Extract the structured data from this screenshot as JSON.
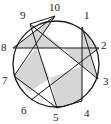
{
  "diagram": {
    "type": "circle-chord-diagram",
    "circle": {
      "cx": 56,
      "cy": 64,
      "r": 43
    },
    "colors": {
      "stroke": "#1a1a1a",
      "fill": "#d6d6d6",
      "label": "#222222"
    },
    "points": [
      {
        "id": "1",
        "x": 82,
        "y": 27,
        "lx": 84,
        "ly": 10
      },
      {
        "id": "2",
        "x": 99,
        "y": 48,
        "lx": 101,
        "ly": 40
      },
      {
        "id": "3",
        "x": 98,
        "y": 79,
        "lx": 103,
        "ly": 76
      },
      {
        "id": "4",
        "x": 82,
        "y": 101,
        "lx": 84,
        "ly": 108
      },
      {
        "id": "5",
        "x": 57,
        "y": 108,
        "lx": 53,
        "ly": 112
      },
      {
        "id": "6",
        "x": 31,
        "y": 100,
        "lx": 21,
        "ly": 105
      },
      {
        "id": "7",
        "x": 14,
        "y": 76,
        "lx": 2,
        "ly": 75
      },
      {
        "id": "8",
        "x": 13,
        "y": 48,
        "lx": 1,
        "ly": 42
      },
      {
        "id": "9",
        "x": 30,
        "y": 24,
        "lx": 20,
        "ly": 10
      },
      {
        "id": "10",
        "x": 55,
        "y": 16,
        "lx": 49,
        "ly": 2
      }
    ],
    "chords": [
      [
        "8",
        "2"
      ],
      [
        "1",
        "4"
      ],
      [
        "1",
        "3"
      ],
      [
        "9",
        "3"
      ],
      [
        "9",
        "5"
      ],
      [
        "10",
        "8"
      ],
      [
        "10",
        "7"
      ],
      [
        "10",
        "9"
      ],
      [
        "6",
        "2"
      ],
      [
        "7",
        "5"
      ],
      [
        "5",
        "4"
      ]
    ]
  }
}
